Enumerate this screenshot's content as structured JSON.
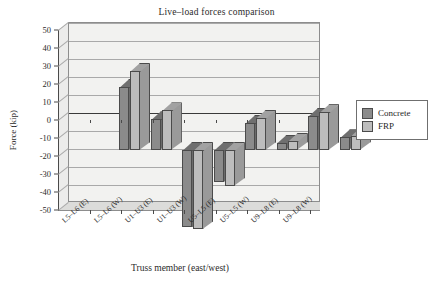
{
  "chart_data": {
    "type": "bar",
    "title": "Live–load forces comparison",
    "xlabel": "Truss member (east/west)",
    "ylabel": "Force (kip)",
    "ylim": [
      -50,
      50
    ],
    "ytick_step": 10,
    "grid": true,
    "legend_position": "right",
    "style": "3d-clustered-column",
    "categories": [
      "L5–L6 (E)",
      "L5–L6 (W)",
      "U1–U3 (E)",
      "U1–U3 (W)",
      "U5–L5 (E)",
      "U5–L5 (W)",
      "U9–L8 (E)",
      "U9–L8 (W)"
    ],
    "yticks": [
      "50",
      "40",
      "30",
      "20",
      "10",
      "0",
      "-10",
      "-20",
      "-30",
      "-40",
      "-50"
    ],
    "series": [
      {
        "name": "Concrete",
        "color": "#8b8b8b",
        "values": [
          35,
          17,
          -43,
          -18,
          15,
          4,
          19,
          7
        ]
      },
      {
        "name": "FRP",
        "color": "#bdbdbd",
        "values": [
          44,
          22,
          -44,
          -20,
          18,
          5,
          21,
          8
        ]
      }
    ]
  },
  "legend": {
    "items": [
      {
        "label": "Concrete",
        "swatch": "#8b8b8b"
      },
      {
        "label": "FRP",
        "swatch": "#bdbdbd"
      }
    ]
  }
}
